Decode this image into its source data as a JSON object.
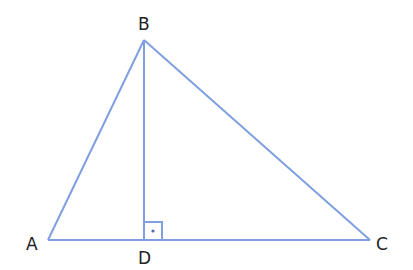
{
  "diagram": {
    "type": "triangle-with-altitude",
    "line_color": "#7f9fe0",
    "label_color": "#222222",
    "vertices": {
      "A": {
        "label": "A",
        "x": 48,
        "y": 240
      },
      "B": {
        "label": "B",
        "x": 144,
        "y": 40
      },
      "C": {
        "label": "C",
        "x": 370,
        "y": 240
      },
      "D": {
        "label": "D",
        "x": 144,
        "y": 240
      }
    },
    "segments": [
      "AB",
      "BC",
      "CA",
      "BD"
    ],
    "right_angle_marker": {
      "at": "D",
      "size": 18,
      "dot": true
    }
  }
}
